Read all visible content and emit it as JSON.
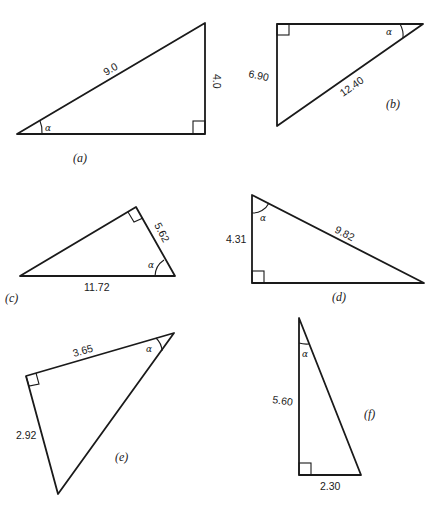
{
  "figure": {
    "angle_symbol": "α",
    "triangles": [
      {
        "caption": "(a)",
        "side_labels": [
          "9.0",
          "4.0"
        ]
      },
      {
        "caption": "(b)",
        "side_labels": [
          "6.90",
          "12.40"
        ]
      },
      {
        "caption": "(c)",
        "side_labels": [
          "5.62",
          "11.72"
        ]
      },
      {
        "caption": "(d)",
        "side_labels": [
          "4.31",
          "9.82"
        ]
      },
      {
        "caption": "(e)",
        "side_labels": [
          "3.65",
          "2.92"
        ]
      },
      {
        "caption": "(f)",
        "side_labels": [
          "5.60",
          "2.30"
        ]
      }
    ]
  }
}
